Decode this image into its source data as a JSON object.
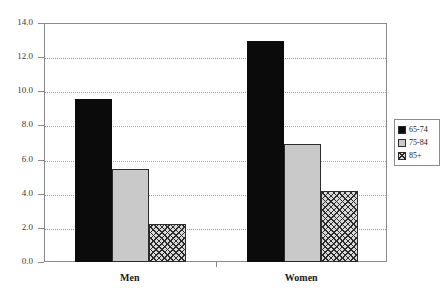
{
  "chart_data": {
    "type": "bar",
    "title": "",
    "subtitle": "",
    "xlabel": "",
    "ylabel": "",
    "categories": [
      "Men",
      "Women"
    ],
    "series": [
      {
        "name": "65-74",
        "values": [
          9.6,
          13.0
        ],
        "fill": "solid",
        "color": "#0b0b0b"
      },
      {
        "name": "75-84",
        "values": [
          5.5,
          7.0
        ],
        "fill": "light",
        "color": "#c9c9c9"
      },
      {
        "name": "85+",
        "values": [
          2.3,
          4.2
        ],
        "fill": "hatch",
        "color": "#d9d9d9"
      }
    ],
    "ylim": [
      0.0,
      14.0
    ],
    "ytick_step": 2.0,
    "ytick_labels": [
      "0.0",
      "2.0",
      "4.0",
      "6.0",
      "8.0",
      "10.0",
      "12.0",
      "14.0"
    ],
    "ytick_values": [
      0.0,
      2.0,
      4.0,
      6.0,
      8.0,
      10.0,
      12.0,
      14.0
    ],
    "grid": true,
    "grid_style": "dotted-horizontal",
    "legend_position": "right",
    "legend_entries": [
      "65-74",
      "75-84",
      "85+"
    ],
    "frame_color": "#8a8a8a",
    "grid_color": "#9a9a9a"
  }
}
